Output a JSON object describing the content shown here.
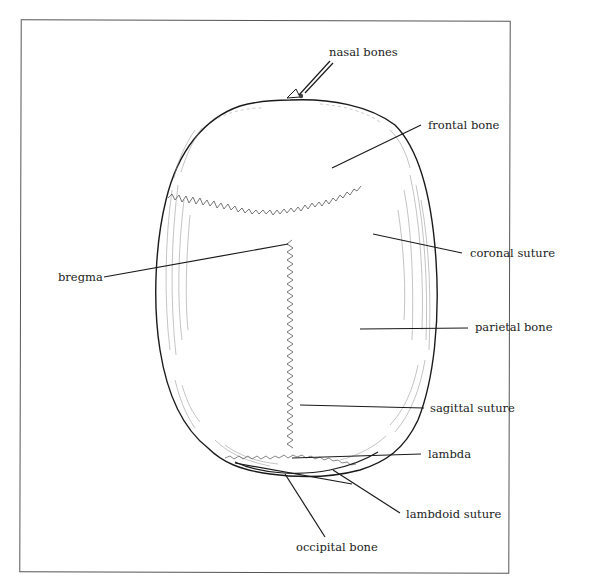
{
  "diagram": {
    "title": "",
    "style": "black-and-white line drawing",
    "colors": {
      "line": "#1a1a1a",
      "suture": "#555555",
      "hatching": "#888888",
      "frame": "#555555",
      "background": "#ffffff"
    },
    "labels": [
      {
        "id": "nasal-bones",
        "text": "nasal bones"
      },
      {
        "id": "frontal-bone",
        "text": "frontal bone"
      },
      {
        "id": "coronal-suture",
        "text": "coronal suture"
      },
      {
        "id": "bregma",
        "text": "bregma"
      },
      {
        "id": "parietal-bone",
        "text": "parietal bone"
      },
      {
        "id": "sagittal-suture",
        "text": "sagittal suture"
      },
      {
        "id": "lambda",
        "text": "lambda"
      },
      {
        "id": "lambdoid-suture",
        "text": "lambdoid suture"
      },
      {
        "id": "occipital-bone",
        "text": "occipital bone"
      }
    ]
  }
}
